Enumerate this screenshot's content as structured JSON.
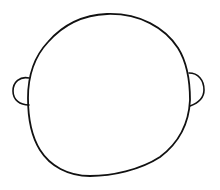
{
  "drawing": {
    "subject": "head outline with ears",
    "parts": [
      "head",
      "left-ear",
      "right-ear"
    ],
    "colors": {
      "background": "#ffffff",
      "line": "#111111"
    }
  }
}
